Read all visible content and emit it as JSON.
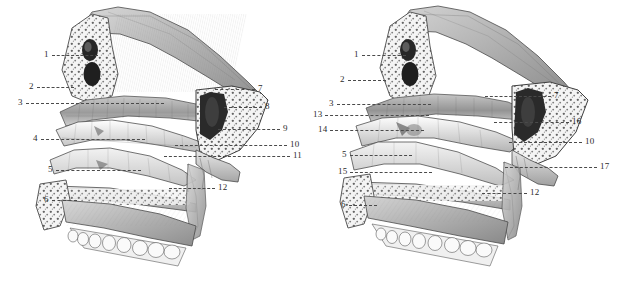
{
  "figure": {
    "background_color": "#ffffff",
    "ink_color": "#3a3a3a",
    "label_color": "#2b2b2b",
    "leader_color": "#4a4a4a",
    "panel_count": 2,
    "style": "engraved anatomical halftone illustration"
  },
  "panels": [
    {
      "id": "panel-left",
      "name": "left-panel",
      "caption": "",
      "labels": [
        {
          "num": "1",
          "side": "left",
          "x": 44,
          "y": 55,
          "leader": 46
        },
        {
          "num": "2",
          "side": "left",
          "x": 29,
          "y": 87,
          "leader": 37
        },
        {
          "num": "3",
          "side": "left",
          "x": 18,
          "y": 103,
          "leader": 138
        },
        {
          "num": "4",
          "side": "left",
          "x": 33,
          "y": 139,
          "leader": 104
        },
        {
          "num": "5",
          "side": "left",
          "x": 48,
          "y": 170,
          "leader": 85
        },
        {
          "num": "6",
          "side": "left",
          "x": 44,
          "y": 200,
          "leader": 25
        },
        {
          "num": "7",
          "side": "right",
          "x": 258,
          "y": 89,
          "leader": 40
        },
        {
          "num": "8",
          "side": "right",
          "x": 265,
          "y": 107,
          "leader": 38
        },
        {
          "num": "9",
          "side": "right",
          "x": 283,
          "y": 129,
          "leader": 62
        },
        {
          "num": "10",
          "side": "right",
          "x": 290,
          "y": 145,
          "leader": 112
        },
        {
          "num": "11",
          "side": "right",
          "x": 293,
          "y": 156,
          "leader": 126
        },
        {
          "num": "12",
          "side": "right",
          "x": 218,
          "y": 188,
          "leader": 46
        }
      ]
    },
    {
      "id": "panel-right",
      "name": "right-panel",
      "caption": "",
      "labels": [
        {
          "num": "1",
          "side": "left",
          "x": 354,
          "y": 55,
          "leader": 44
        },
        {
          "num": "2",
          "side": "left",
          "x": 340,
          "y": 80,
          "leader": 38
        },
        {
          "num": "3",
          "side": "left",
          "x": 329,
          "y": 104,
          "leader": 94
        },
        {
          "num": "13",
          "side": "left",
          "x": 313,
          "y": 115,
          "leader": 104
        },
        {
          "num": "14",
          "side": "left",
          "x": 318,
          "y": 130,
          "leader": 94
        },
        {
          "num": "5",
          "side": "left",
          "x": 342,
          "y": 155,
          "leader": 62
        },
        {
          "num": "15",
          "side": "left",
          "x": 338,
          "y": 172,
          "leader": 82
        },
        {
          "num": "6",
          "side": "left",
          "x": 341,
          "y": 205,
          "leader": 28
        },
        {
          "num": "7",
          "side": "right",
          "x": 554,
          "y": 96,
          "leader": 66
        },
        {
          "num": "16",
          "side": "right",
          "x": 572,
          "y": 122,
          "leader": 75
        },
        {
          "num": "10",
          "side": "right",
          "x": 585,
          "y": 142,
          "leader": 73
        },
        {
          "num": "17",
          "side": "right",
          "x": 600,
          "y": 167,
          "leader": 92
        },
        {
          "num": "12",
          "side": "right",
          "x": 530,
          "y": 193,
          "leader": 45
        }
      ]
    }
  ]
}
